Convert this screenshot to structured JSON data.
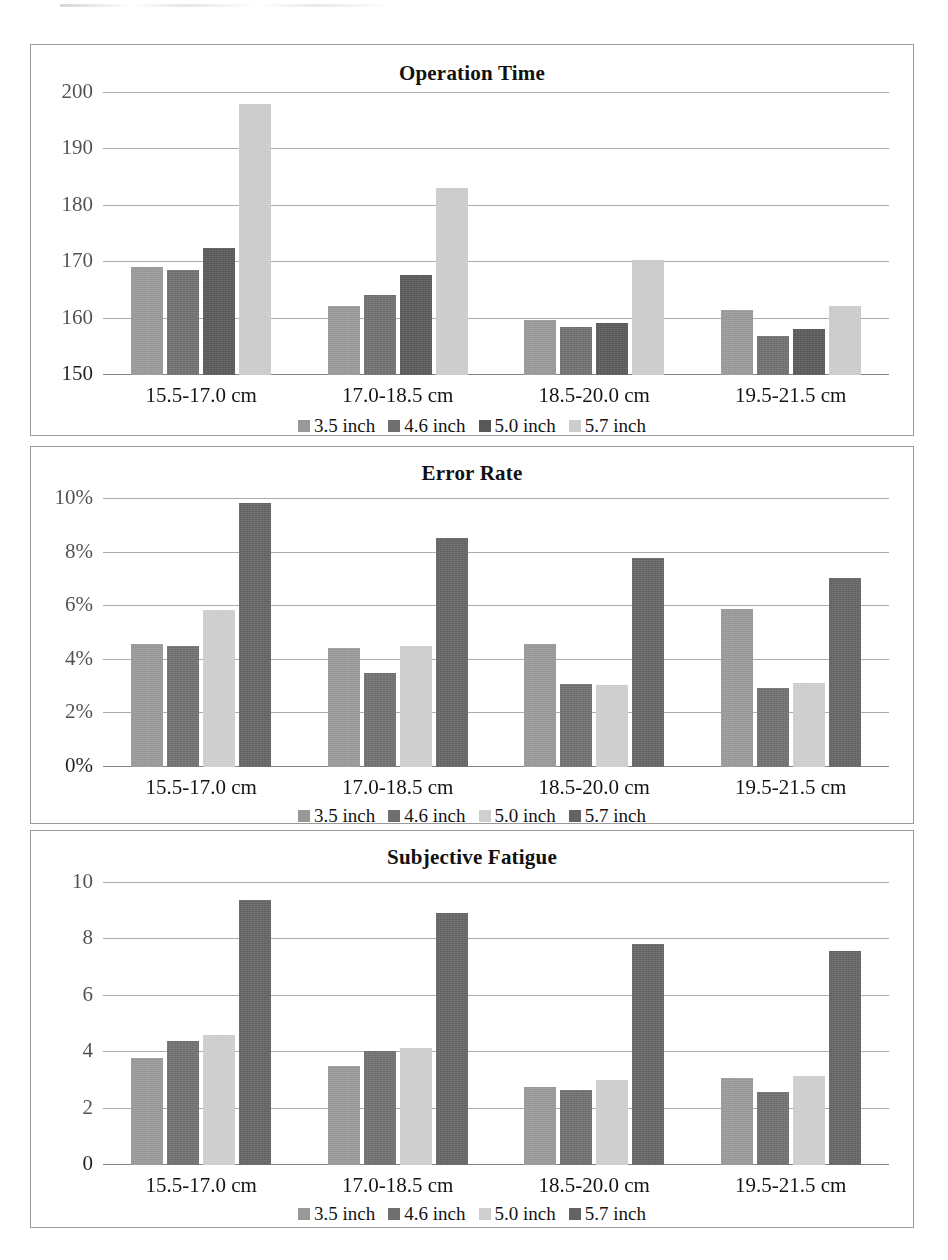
{
  "series_colors": {
    "s1_medium": "#989898",
    "s2_dark": "#6f6f6f",
    "s3_darker": "#585858",
    "s3_light": "#cfcfcf",
    "s4_light": "#cdcdcd",
    "s4_dark": "#636363",
    "gridline": "#8f8f8f",
    "panel_border": "#9a9a9a",
    "text": "#141414"
  },
  "legend": {
    "items": [
      {
        "label": "3.5 inch"
      },
      {
        "label": "4.6 inch"
      },
      {
        "label": "5.0 inch"
      },
      {
        "label": "5.7 inch"
      }
    ]
  },
  "categories": [
    "15.5-17.0 cm",
    "17.0-18.5 cm",
    "18.5-20.0 cm",
    "19.5-21.5 cm"
  ],
  "chart_data": [
    {
      "type": "bar",
      "title": "Operation Time",
      "xlabel": "",
      "ylabel": "",
      "ylim": [
        150,
        200
      ],
      "yticks": [
        150,
        160,
        170,
        180,
        190,
        200
      ],
      "ytick_labels": [
        "150",
        "160",
        "170",
        "180",
        "190",
        "200"
      ],
      "grid": true,
      "legend_position": "bottom",
      "categories": [
        "15.5-17.0 cm",
        "17.0-18.5 cm",
        "18.5-20.0 cm",
        "19.5-21.5 cm"
      ],
      "series": [
        {
          "name": "3.5 inch",
          "color": "#989898",
          "values": [
            169.2,
            162.3,
            159.8,
            161.6
          ]
        },
        {
          "name": "4.6 inch",
          "color": "#6f6f6f",
          "values": [
            168.7,
            164.2,
            158.6,
            157.0
          ]
        },
        {
          "name": "5.0 inch",
          "color": "#585858",
          "values": [
            172.5,
            167.8,
            159.3,
            158.1
          ]
        },
        {
          "name": "5.7 inch",
          "color": "#cdcdcd",
          "values": [
            198.0,
            183.2,
            170.4,
            162.3
          ]
        }
      ]
    },
    {
      "type": "bar",
      "title": "Error Rate",
      "xlabel": "",
      "ylabel": "",
      "ylim": [
        0,
        10
      ],
      "yticks": [
        0,
        2,
        4,
        6,
        8,
        10
      ],
      "ytick_labels": [
        "0%",
        "2%",
        "4%",
        "6%",
        "8%",
        "10%"
      ],
      "grid": true,
      "legend_position": "bottom",
      "categories": [
        "15.5-17.0 cm",
        "17.0-18.5 cm",
        "18.5-20.0 cm",
        "19.5-21.5 cm"
      ],
      "series": [
        {
          "name": "3.5 inch",
          "color": "#989898",
          "values": [
            4.6,
            4.45,
            4.6,
            5.9
          ]
        },
        {
          "name": "4.6 inch",
          "color": "#6f6f6f",
          "values": [
            4.5,
            3.5,
            3.1,
            2.95
          ]
        },
        {
          "name": "5.0 inch",
          "color": "#cfcfcf",
          "values": [
            5.85,
            4.5,
            3.05,
            3.15
          ]
        },
        {
          "name": "5.7 inch",
          "color": "#636363",
          "values": [
            9.85,
            8.55,
            7.8,
            7.05
          ]
        }
      ]
    },
    {
      "type": "bar",
      "title": "Subjective Fatigue",
      "xlabel": "",
      "ylabel": "",
      "ylim": [
        0,
        10
      ],
      "yticks": [
        0,
        2,
        4,
        6,
        8,
        10
      ],
      "ytick_labels": [
        "0",
        "2",
        "4",
        "6",
        "8",
        "10"
      ],
      "grid": true,
      "legend_position": "bottom",
      "categories": [
        "15.5-17.0 cm",
        "17.0-18.5 cm",
        "18.5-20.0 cm",
        "19.5-21.5 cm"
      ],
      "series": [
        {
          "name": "3.5 inch",
          "color": "#989898",
          "values": [
            3.8,
            3.5,
            2.75,
            3.1
          ]
        },
        {
          "name": "4.6 inch",
          "color": "#6f6f6f",
          "values": [
            4.4,
            4.05,
            2.65,
            2.6
          ]
        },
        {
          "name": "5.0 inch",
          "color": "#cfcfcf",
          "values": [
            4.6,
            4.15,
            3.0,
            3.15
          ]
        },
        {
          "name": "5.7 inch",
          "color": "#636363",
          "values": [
            9.4,
            8.95,
            7.85,
            7.6
          ]
        }
      ]
    }
  ]
}
